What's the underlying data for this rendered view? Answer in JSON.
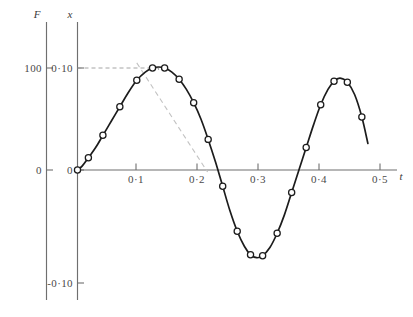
{
  "figure": {
    "background_color": "#ffffff",
    "curve_color": "#1c1c1c",
    "axis_color": "#6f6f6f",
    "guide_color": "#9a9a9a",
    "slope_guide_color": "#c2c2c2"
  },
  "chart_data": {
    "type": "line",
    "title": "",
    "xlabel": "t",
    "ylabel": "x",
    "secondary_ylabel": "F",
    "xlim": [
      0,
      0.52
    ],
    "ylim": [
      -0.115,
      0.118
    ],
    "grid": false,
    "legend": "none",
    "markers": "open-circle",
    "x_ticks": [
      {
        "value": 0.1,
        "label": "0·1"
      },
      {
        "value": 0.2,
        "label": "0·2"
      },
      {
        "value": 0.3,
        "label": "0·3"
      },
      {
        "value": 0.4,
        "label": "0·4"
      },
      {
        "value": 0.5,
        "label": "0·5"
      }
    ],
    "y_ticks": [
      {
        "value": 0.1,
        "label": "0·10"
      },
      {
        "value": 0.0,
        "label": "0"
      },
      {
        "value": -0.1,
        "label": "-0·10"
      }
    ],
    "secondary_y_ticks": [
      {
        "value": 100,
        "label": "100"
      },
      {
        "value": 0,
        "label": "0"
      }
    ],
    "series": [
      {
        "name": "x",
        "x": [
          0.0,
          0.008,
          0.018,
          0.03,
          0.042,
          0.056,
          0.07,
          0.084,
          0.098,
          0.112,
          0.124,
          0.134,
          0.144,
          0.156,
          0.168,
          0.18,
          0.192,
          0.204,
          0.216,
          0.228,
          0.24,
          0.252,
          0.264,
          0.276,
          0.286,
          0.296,
          0.306,
          0.318,
          0.33,
          0.342,
          0.354,
          0.366,
          0.378,
          0.39,
          0.402,
          0.414,
          0.424,
          0.434,
          0.446,
          0.458,
          0.47,
          0.48
        ],
        "y": [
          0.0,
          0.004,
          0.012,
          0.022,
          0.034,
          0.048,
          0.062,
          0.076,
          0.088,
          0.096,
          0.1,
          0.101,
          0.1,
          0.096,
          0.089,
          0.079,
          0.066,
          0.05,
          0.03,
          0.008,
          -0.016,
          -0.04,
          -0.06,
          -0.075,
          -0.083,
          -0.086,
          -0.084,
          -0.076,
          -0.062,
          -0.044,
          -0.022,
          0.0,
          0.022,
          0.044,
          0.064,
          0.079,
          0.087,
          0.09,
          0.086,
          0.074,
          0.052,
          0.026
        ]
      }
    ],
    "annotations": [
      {
        "kind": "horizontal-leader",
        "label": "peak level reference at x = 0·10",
        "from": [
          0.0,
          0.1
        ],
        "to": [
          0.134,
          0.1
        ],
        "style": "dashed"
      },
      {
        "kind": "vertical-leader",
        "label": "peak position drop line",
        "from": [
          0.134,
          0.1
        ],
        "to": [
          0.134,
          0.098
        ],
        "style": "dashed"
      },
      {
        "kind": "slope-guide",
        "label": "tangent / decay guide line",
        "from": [
          0.098,
          0.105
        ],
        "to": [
          0.215,
          -0.002
        ],
        "style": "dash-dot"
      }
    ]
  }
}
